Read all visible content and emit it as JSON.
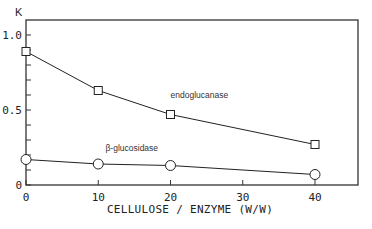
{
  "chart_data": {
    "type": "line",
    "title": "",
    "xlabel": "CELLULOSE / ENZYME (W/W)",
    "ylabel": "K",
    "xlim": [
      0,
      46
    ],
    "ylim": [
      0,
      1.1
    ],
    "x_ticks": [
      0,
      10,
      20,
      30,
      40
    ],
    "x_tick_labels": [
      "0",
      "10",
      "20",
      "30",
      "40"
    ],
    "y_ticks": [
      0,
      0.1,
      0.2,
      0.3,
      0.4,
      0.5,
      0.6,
      0.7,
      0.8,
      0.9,
      1.0
    ],
    "y_tick_labels": [
      {
        "value": 0,
        "label": "0"
      },
      {
        "value": 0.5,
        "label": "0.5"
      },
      {
        "value": 1.0,
        "label": "1.0"
      }
    ],
    "grid": false,
    "legend": "inline labels",
    "series": [
      {
        "name": "endoglucanase",
        "marker": "square",
        "x": [
          0,
          10,
          20,
          40
        ],
        "values": [
          0.89,
          0.63,
          0.47,
          0.27
        ],
        "label_pos": {
          "x": 20,
          "y": 0.58
        }
      },
      {
        "name": "β-glucosidase",
        "marker": "circle",
        "x": [
          0,
          10,
          20,
          40
        ],
        "values": [
          0.17,
          0.14,
          0.13,
          0.07
        ],
        "label_pos": {
          "x": 11,
          "y": 0.23
        }
      }
    ]
  },
  "colors": {
    "line": "#222222",
    "frame": "#333333",
    "background": "#ffffff"
  }
}
